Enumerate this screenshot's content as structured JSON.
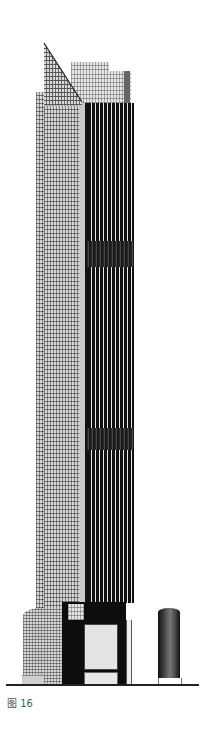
{
  "figure": {
    "caption": "图 16"
  },
  "colors": {
    "background": "#ffffff",
    "dark_facade": "#111111",
    "glass": "#d8d8d8",
    "ground_line": "#222222",
    "caption": "#555555"
  },
  "elements": {
    "glass_tower": "glass-facade-tower",
    "sloped_spire": "sloped-spire",
    "mesh_crown": "mesh-crown-block",
    "dark_tower": "dark-grid-tower",
    "podium": "podium-base",
    "cylinder": "cylindrical-pavilion",
    "ground": "ground-line"
  }
}
